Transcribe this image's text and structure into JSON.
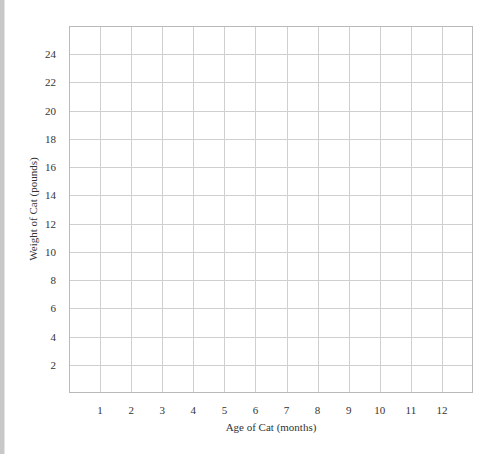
{
  "chart_data": {
    "type": "line",
    "title": "",
    "xlabel": "Age of Cat (months)",
    "ylabel": "Weight of Cat (pounds)",
    "x_ticks": [
      "1",
      "2",
      "3",
      "4",
      "5",
      "6",
      "7",
      "8",
      "9",
      "10",
      "11",
      "12"
    ],
    "y_ticks": [
      "2",
      "4",
      "6",
      "8",
      "10",
      "12",
      "14",
      "16",
      "18",
      "20",
      "22",
      "24"
    ],
    "xlim": [
      0,
      13
    ],
    "ylim": [
      0,
      26
    ],
    "grid": true,
    "legend": null,
    "series": []
  },
  "colors": {
    "grid": "#cfcfcf",
    "frame": "#b9b9b9",
    "text": "#333333",
    "left_bar": "#c8c8c8"
  }
}
